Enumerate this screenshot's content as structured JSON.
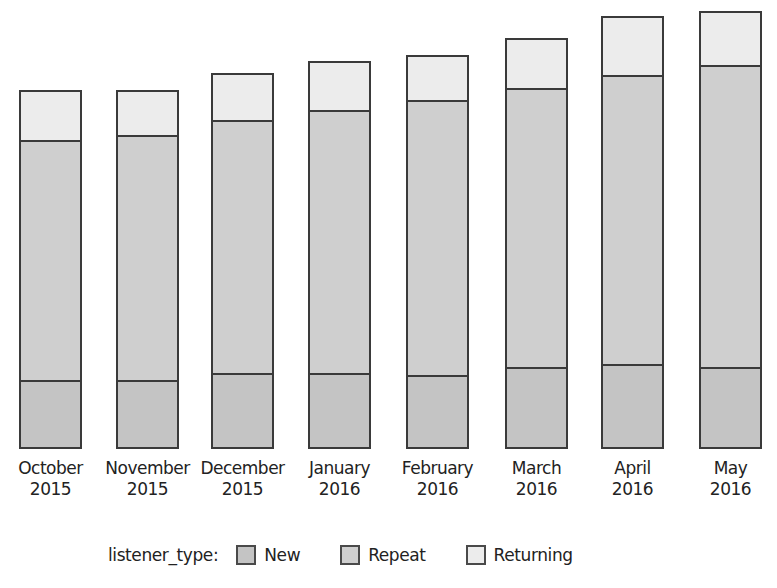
{
  "chart_data": {
    "type": "bar",
    "stacked": true,
    "title": "",
    "xlabel": "",
    "ylabel": "",
    "y_axis_visible": false,
    "value_units": "relative (pixel height; no axis shown)",
    "categories": [
      "October\n2015",
      "November\n2015",
      "December\n2015",
      "January\n2016",
      "February\n2016",
      "March\n2016",
      "April\n2016",
      "May\n2016"
    ],
    "category_lines": [
      [
        "October",
        "2015"
      ],
      [
        "November",
        "2015"
      ],
      [
        "December",
        "2015"
      ],
      [
        "January",
        "2016"
      ],
      [
        "February",
        "2016"
      ],
      [
        "March",
        "2016"
      ],
      [
        "April",
        "2016"
      ],
      [
        "May",
        "2016"
      ]
    ],
    "series": [
      {
        "name": "New",
        "color": "#c4c4c4",
        "values": [
          67,
          67,
          74,
          74,
          72,
          80,
          83,
          80
        ]
      },
      {
        "name": "Repeat",
        "color": "#cfcfcf",
        "values": [
          240,
          245,
          253,
          263,
          275,
          279,
          289,
          302
        ]
      },
      {
        "name": "Returning",
        "color": "#ececec",
        "values": [
          52,
          47,
          49,
          51,
          47,
          52,
          61,
          56
        ]
      }
    ],
    "totals": [
      359,
      359,
      376,
      388,
      394,
      411,
      433,
      438
    ],
    "grid": false,
    "legend": {
      "title": "listener_type:",
      "position": "bottom",
      "entries": [
        "New",
        "Repeat",
        "Returning"
      ]
    }
  },
  "layout": {
    "baseline_y": 449,
    "bar_left_x": [
      19,
      116,
      211,
      308,
      406,
      505,
      601,
      699
    ],
    "bar_width": 63
  },
  "legend": {
    "title": "listener_type:",
    "items": [
      {
        "label": "New",
        "color": "#c4c4c4"
      },
      {
        "label": "Repeat",
        "color": "#cfcfcf"
      },
      {
        "label": "Returning",
        "color": "#ececec"
      }
    ]
  }
}
